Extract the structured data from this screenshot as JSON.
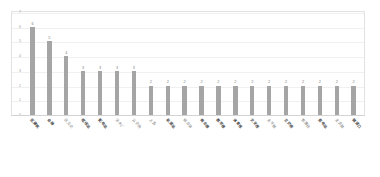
{
  "chart_data": {
    "type": "bar",
    "title": "",
    "subtitle": "",
    "xlabel": "",
    "ylabel": "",
    "ylim": [
      0,
      7
    ],
    "grid": true,
    "legend": "none",
    "orientation": "vertical",
    "bar_color": "#a5a5a5",
    "label_rotation_deg": 45,
    "y_ticks": [
      "0",
      "1",
      "2",
      "3",
      "4",
      "5",
      "6",
      "7"
    ],
    "categories": [
      "区建筑",
      "会展",
      "区立交",
      "枢纽站",
      "配电站",
      "污水厂",
      "公交场",
      "上盖",
      "轨道站",
      "综合体",
      "商业楼",
      "教学楼",
      "体育馆",
      "文化馆",
      "主干路",
      "立交桥",
      "管廊段",
      "变电站",
      "主支路",
      "隧道口"
    ],
    "values": [
      6,
      5,
      4,
      3,
      3,
      3,
      3,
      2,
      2,
      2,
      2,
      2,
      2,
      2,
      2,
      2,
      2,
      2,
      2,
      2
    ],
    "emphasized_categories": [
      "区建筑",
      "会展",
      "枢纽站",
      "配电站",
      "轨道站",
      "商业楼",
      "教学楼",
      "体育馆",
      "文化馆",
      "立交桥",
      "变电站",
      "隧道口"
    ]
  }
}
